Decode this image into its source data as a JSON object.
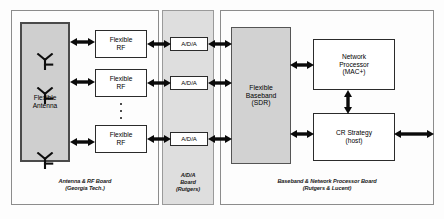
{
  "figure": {
    "type": "block-diagram"
  },
  "boards": [
    {
      "id": "antenna-rf-board",
      "caption": "Antenna & RF Board\n(Georgia Tech.)",
      "shaded": false
    },
    {
      "id": "ada-board",
      "caption": "A/D/A\nBoard\n(Rutgers)",
      "shaded": true
    },
    {
      "id": "baseband-board",
      "caption": "Baseband & Network Processor Board\n(Rutgers & Lucent)",
      "shaded": false
    }
  ],
  "blocks": {
    "flexible_antenna": {
      "label": "Flexible\nAntenna",
      "antenna_count": 3,
      "antenna_icon": "antenna-icon"
    },
    "flexible_rf": [
      {
        "label": "Flexible\nRF"
      },
      {
        "label": "Flexible\nRF"
      },
      {
        "label": "Flexible\nRF"
      }
    ],
    "ada": [
      {
        "label": "A/D/A"
      },
      {
        "label": "A/D/A"
      },
      {
        "label": "A/D/A"
      }
    ],
    "flexible_baseband": {
      "label": "Flexible\nBaseband\n(SDR)"
    },
    "network_processor": {
      "label": "Network\nProcessor\n(MAC+)"
    },
    "cr_strategy": {
      "label": "CR Strategy\n(host)"
    }
  },
  "ellipsis": {
    "rf_column": "···",
    "dot_count": 3
  },
  "connections": [
    {
      "from": "flexible_antenna",
      "to": "flexible_rf_1",
      "kind": "bidirectional"
    },
    {
      "from": "flexible_antenna",
      "to": "flexible_rf_2",
      "kind": "bidirectional"
    },
    {
      "from": "flexible_antenna",
      "to": "flexible_rf_3",
      "kind": "bidirectional"
    },
    {
      "from": "flexible_rf_1",
      "to": "ada_1",
      "kind": "bidirectional"
    },
    {
      "from": "flexible_rf_2",
      "to": "ada_2",
      "kind": "bidirectional"
    },
    {
      "from": "flexible_rf_3",
      "to": "ada_3",
      "kind": "bidirectional"
    },
    {
      "from": "ada_1",
      "to": "flexible_baseband",
      "kind": "bidirectional"
    },
    {
      "from": "ada_2",
      "to": "flexible_baseband",
      "kind": "bidirectional"
    },
    {
      "from": "ada_3",
      "to": "flexible_baseband",
      "kind": "bidirectional"
    },
    {
      "from": "flexible_baseband",
      "to": "network_processor",
      "kind": "bidirectional"
    },
    {
      "from": "flexible_baseband",
      "to": "cr_strategy",
      "kind": "bidirectional"
    },
    {
      "from": "network_processor",
      "to": "cr_strategy",
      "kind": "bidirectional"
    },
    {
      "from": "cr_strategy",
      "to": "external",
      "kind": "bidirectional"
    }
  ],
  "colors": {
    "board_border": "#8c8c8c",
    "shaded_board_fill": "#dedede",
    "block_border": "#2b2b2b",
    "gray_block_fill": "#cfcfcf",
    "arrow": "#0a0a0a",
    "background": "#ffffff"
  }
}
